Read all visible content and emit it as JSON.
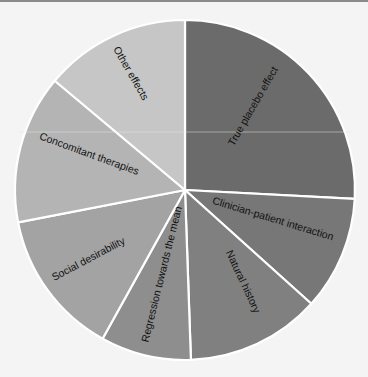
{
  "chart_data": {
    "type": "pie",
    "title": "",
    "start_angle_deg": 0,
    "direction": "clockwise",
    "categories": [
      "True placebo effect",
      "Clinician-patient interaction",
      "Natural history",
      "Regression towards the mean",
      "Social desirability",
      "Concomitant therapies",
      "Other effects"
    ],
    "values": [
      93,
      39,
      46,
      31,
      50,
      51,
      50
    ],
    "value_unit": "degrees (estimated from pixel geometry)",
    "percent_estimates": [
      25.8,
      10.8,
      12.8,
      8.6,
      13.9,
      14.2,
      13.9
    ],
    "colors": [
      "#6b6b6b",
      "#777777",
      "#808080",
      "#8e8e8e",
      "#a3a3a3",
      "#b4b4b4",
      "#c6c6c6"
    ],
    "legend": "none (labels inside slices)",
    "grid": false
  },
  "labels": {
    "s0": "True placebo effect",
    "s1": "Clinician-patient interaction",
    "s2": "Natural history",
    "s3": "Regression towards the mean",
    "s4": "Social desirability",
    "s5": "Concomitant therapies",
    "s6": "Other effects"
  }
}
